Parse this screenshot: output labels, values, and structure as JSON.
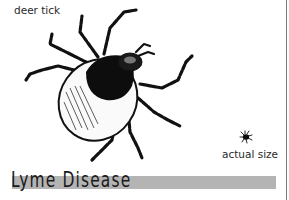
{
  "illustration": {
    "label_top": "deer tick",
    "label_size": "actual size",
    "subject_icon": "deer-tick-illustration",
    "mini_icon": "actual-size-tick-icon"
  },
  "title": {
    "text": "Lyme Disease",
    "bar_color": "#b4b4b4"
  }
}
